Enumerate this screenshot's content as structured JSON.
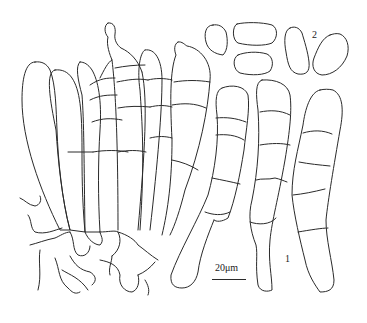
{
  "figure": {
    "type": "scientific line drawing",
    "panels": [
      {
        "id": "panel-1",
        "label": "1",
        "content": "conidiophores / septate cells arising from basal stroma"
      },
      {
        "id": "panel-2",
        "label": "2",
        "content": "conidia (5 spores)"
      }
    ],
    "scale_bar": {
      "label": "20μm"
    },
    "line_color": "#2a2a2a",
    "background": "#ffffff"
  }
}
